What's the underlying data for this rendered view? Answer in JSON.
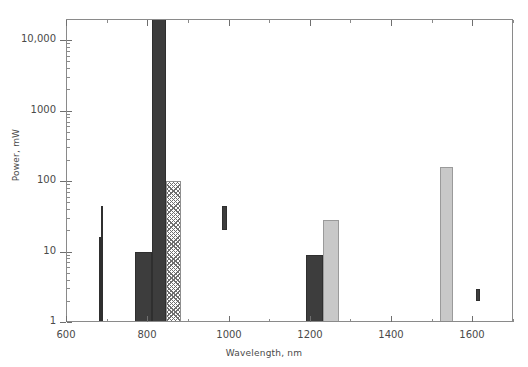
{
  "chart_data": {
    "type": "bar",
    "title": "",
    "xlabel": "Wavelength, nm",
    "ylabel": "Power, mW",
    "xlim": [
      600,
      1700
    ],
    "ylim": [
      1,
      20000
    ],
    "yscale": "log",
    "xscale": "linear",
    "grid": false,
    "legend": null,
    "xticks": [
      600,
      800,
      1000,
      1200,
      1400,
      1600
    ],
    "xtick_labels": [
      "600",
      "800",
      "1000",
      "1200",
      "1400",
      "1600"
    ],
    "xminor_ticks": [
      700,
      900,
      1100,
      1300,
      1500,
      1700
    ],
    "yticks": [
      1,
      10,
      100,
      1000,
      10000
    ],
    "ytick_labels": [
      "1",
      "10",
      "100",
      "1000",
      "10,000"
    ],
    "bars": [
      {
        "name": "bar-680-low",
        "x_start": 680,
        "x_end": 687,
        "y_bottom": 1,
        "y_top": 16,
        "fill": "solid-dark"
      },
      {
        "name": "bar-687-high",
        "x_start": 687,
        "x_end": 692,
        "y_bottom": 1,
        "y_top": 45,
        "fill": "solid-dark"
      },
      {
        "name": "bar-770-810",
        "x_start": 770,
        "x_end": 812,
        "y_bottom": 1,
        "y_top": 9.7,
        "fill": "solid-dark"
      },
      {
        "name": "bar-812-845",
        "x_start": 812,
        "x_end": 845,
        "y_bottom": 1,
        "y_top": 20000,
        "fill": "solid-dark"
      },
      {
        "name": "bar-845-882",
        "x_start": 845,
        "x_end": 882,
        "y_bottom": 1,
        "y_top": 100,
        "fill": "hatch"
      },
      {
        "name": "bar-985-997",
        "x_start": 985,
        "x_end": 997,
        "y_bottom": 20,
        "y_top": 45,
        "fill": "solid-dark"
      },
      {
        "name": "bar-1190-1232",
        "x_start": 1190,
        "x_end": 1232,
        "y_bottom": 1,
        "y_top": 9,
        "fill": "solid-dark"
      },
      {
        "name": "bar-1232-1272",
        "x_start": 1232,
        "x_end": 1272,
        "y_bottom": 1,
        "y_top": 28,
        "fill": "solid-light"
      },
      {
        "name": "bar-1520-1552",
        "x_start": 1520,
        "x_end": 1552,
        "y_bottom": 1,
        "y_top": 160,
        "fill": "solid-light"
      },
      {
        "name": "bar-1608-1620",
        "x_start": 1608,
        "x_end": 1620,
        "y_bottom": 2.0,
        "y_top": 2.9,
        "fill": "solid-dark"
      }
    ],
    "colors": {
      "dark_fill": "#3d3d3d",
      "light_fill": "#c8c8c8",
      "hatch_stroke": "#6f6f6f",
      "axis": "#8a8a8a",
      "text": "#4a4a4a",
      "background": "#ffffff"
    }
  }
}
